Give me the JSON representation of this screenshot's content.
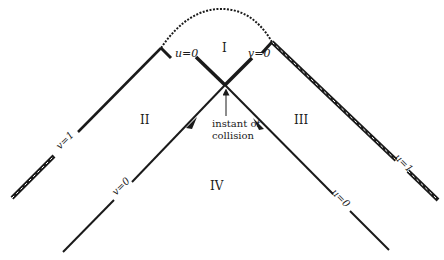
{
  "diagram": {
    "colors": {
      "ink": "#1a1a1a",
      "background": "#ffffff",
      "hatch": "#ffffff"
    },
    "regions": {
      "I": "I",
      "II": "II",
      "III": "III",
      "IV": "IV"
    },
    "labels": {
      "u0_top": "u=0",
      "v0_top": "v=0",
      "v1_left": "v=1",
      "u1_right": "u=1",
      "v0_bottom": "v=0",
      "u0_bottom": "u=0",
      "collision_line1": "instant of",
      "collision_line2": "collision"
    },
    "lines": [
      {
        "name": "v-equals-1-singular-boundary",
        "from": [
          12,
          198
        ],
        "to": [
          161,
          48
        ],
        "style": "hatched"
      },
      {
        "name": "u-equals-1-singular-boundary",
        "from": [
          272,
          42
        ],
        "to": [
          438,
          200
        ],
        "style": "hatched"
      },
      {
        "name": "v-equals-0-wavefront",
        "from": [
          63,
          252
        ],
        "to": [
          225,
          85
        ],
        "style": "solid",
        "arrow_at": [
          192,
          122
        ]
      },
      {
        "name": "u-equals-0-wavefront",
        "from": [
          389,
          250
        ],
        "to": [
          225,
          85
        ],
        "style": "solid",
        "arrow_at": [
          259,
          124
        ]
      },
      {
        "name": "u-equals-0-region-I",
        "from": [
          225,
          85
        ],
        "to": [
          190,
          52
        ],
        "style": "thick"
      },
      {
        "name": "v-equals-0-region-I",
        "from": [
          225,
          85
        ],
        "to": [
          257,
          53
        ],
        "style": "thick"
      }
    ],
    "singularity_curve": {
      "from": [
        161,
        48
      ],
      "to": [
        272,
        42
      ],
      "style": "wavy"
    },
    "collision_point": [
      225,
      85
    ]
  }
}
